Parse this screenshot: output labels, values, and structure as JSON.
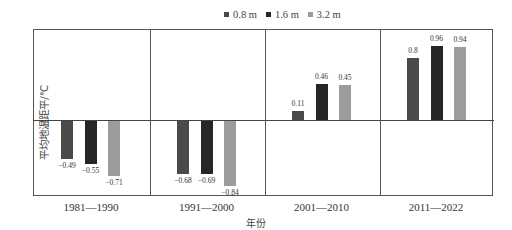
{
  "chart_data": {
    "type": "bar",
    "title": "",
    "xlabel": "年份",
    "ylabel": "平均地温距平/℃",
    "categories": [
      "1981—1990",
      "1991—2000",
      "2001—2010",
      "2011—2022"
    ],
    "series": [
      {
        "name": "0.8 m",
        "color": "#4a4a4a",
        "values": [
          -0.49,
          -0.68,
          0.11,
          0.8
        ]
      },
      {
        "name": "1.6 m",
        "color": "#262626",
        "values": [
          -0.55,
          -0.69,
          0.46,
          0.96
        ]
      },
      {
        "name": "3.2 m",
        "color": "#9c9c9c",
        "values": [
          -0.71,
          -0.84,
          0.45,
          0.94
        ]
      }
    ],
    "data_labels": [
      [
        "-0.49",
        "-0.55",
        "-0.71"
      ],
      [
        "-0.68",
        "-0.69",
        "-0.84"
      ],
      [
        "0.11",
        "0.46",
        "0.45"
      ],
      [
        "0.8",
        "0.96",
        "0.94"
      ]
    ],
    "ylim": [
      -1.0,
      1.16
    ],
    "grid": false,
    "legend_position": "top-center",
    "layout": "four side-by-side panels separated by vertical lines, zero baseline across"
  },
  "legend": [
    {
      "label": "0.8 m",
      "color": "#4a4a4a"
    },
    {
      "label": "1.6 m",
      "color": "#262626"
    },
    {
      "label": "3.2 m",
      "color": "#9c9c9c"
    }
  ],
  "axes": {
    "xlabel": "年份",
    "ylabel": "平均地温距平/℃"
  }
}
